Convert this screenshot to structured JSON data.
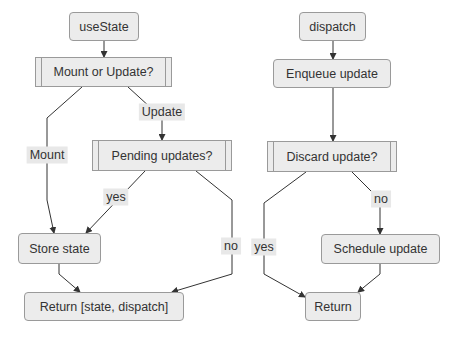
{
  "diagram": {
    "left_flow": {
      "nodes": {
        "use_state": {
          "label": "useState"
        },
        "mount_or_update": {
          "label": "Mount or Update?"
        },
        "pending_updates": {
          "label": "Pending updates?"
        },
        "store_state": {
          "label": "Store state"
        },
        "return_state_dispatch": {
          "label": "Return [state, dispatch]"
        }
      },
      "edge_labels": {
        "update": "Update",
        "mount": "Mount",
        "yes": "yes",
        "no": "no"
      }
    },
    "right_flow": {
      "nodes": {
        "dispatch": {
          "label": "dispatch"
        },
        "enqueue_update": {
          "label": "Enqueue update"
        },
        "discard_update": {
          "label": "Discard update?"
        },
        "schedule_update": {
          "label": "Schedule update"
        },
        "return": {
          "label": "Return"
        }
      },
      "edge_labels": {
        "yes": "yes",
        "no": "no"
      }
    },
    "colors": {
      "node_fill": "#ececec",
      "node_border": "#9a9a9a",
      "edge": "#333333",
      "label_bg": "#e8e8e8",
      "text": "#333333"
    }
  }
}
